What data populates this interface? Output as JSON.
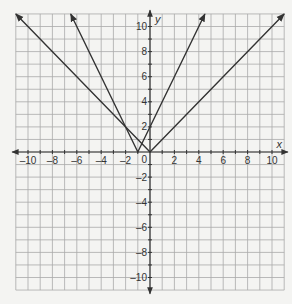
{
  "chart_data": {
    "type": "line",
    "title": "",
    "xlabel": "x",
    "ylabel": "y",
    "xlim": [
      -11,
      11
    ],
    "ylim": [
      -11,
      11
    ],
    "grid": true,
    "x_ticks": [
      -10,
      -8,
      -6,
      -4,
      -2,
      2,
      4,
      6,
      8,
      10
    ],
    "y_ticks": [
      -10,
      -8,
      -6,
      -4,
      -2,
      2,
      4,
      6,
      8,
      10
    ],
    "origin_label": "0",
    "series": [
      {
        "name": "y = |x|",
        "points": [
          [
            -11,
            11
          ],
          [
            0,
            0
          ],
          [
            11,
            11
          ]
        ]
      },
      {
        "name": "y = 2|x + 1|",
        "points": [
          [
            -6.5,
            11
          ],
          [
            -1,
            0
          ],
          [
            4.5,
            11
          ]
        ]
      }
    ]
  }
}
